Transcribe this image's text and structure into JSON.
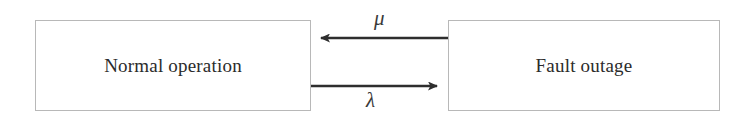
{
  "diagram": {
    "type": "state-transition",
    "background_color": "#ffffff",
    "box_border_color": "#b8b8b8",
    "arrow_color": "#2e2e2e",
    "text_color": "#2b2b2b",
    "states": [
      {
        "id": "normal",
        "label": "Normal operation",
        "position": "left"
      },
      {
        "id": "fault",
        "label": "Fault outage",
        "position": "right"
      }
    ],
    "transitions": [
      {
        "id": "repair",
        "label": "μ",
        "from": "fault",
        "to": "normal",
        "direction": "right-to-left",
        "label_position": "above-arrow"
      },
      {
        "id": "failure",
        "label": "λ",
        "from": "normal",
        "to": "fault",
        "direction": "left-to-right",
        "label_position": "below-arrow"
      }
    ]
  }
}
